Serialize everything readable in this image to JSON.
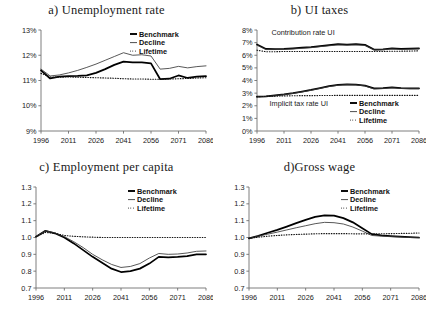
{
  "figure": {
    "panel_count": 4,
    "legend_entries": [
      "Benchmark",
      "Decline",
      "Lifetime"
    ]
  },
  "chart_data": [
    {
      "id": "panel-a",
      "type": "line",
      "title": "a) Unemployment rate",
      "xlabel": "",
      "ylabel": "",
      "grid": false,
      "legend_position": "top-right",
      "x": [
        1996,
        2001,
        2006,
        2011,
        2016,
        2021,
        2026,
        2031,
        2036,
        2041,
        2046,
        2051,
        2056,
        2061,
        2066,
        2071,
        2076,
        2081,
        2086
      ],
      "xlim": [
        1996,
        2086
      ],
      "xticks": [
        1996,
        2011,
        2026,
        2041,
        2056,
        2071,
        2086
      ],
      "xticklabels": [
        "1996",
        "2011",
        "2026",
        "2041",
        "2056",
        "2071",
        "2086"
      ],
      "ylim": [
        9,
        13
      ],
      "yticks": [
        9,
        10,
        11,
        12,
        13
      ],
      "yticklabels": [
        "9%",
        "10%",
        "11%",
        "12%",
        "13%"
      ],
      "series": [
        {
          "name": "Benchmark",
          "style": "thick-solid",
          "values": [
            11.4,
            11.08,
            11.15,
            11.17,
            11.18,
            11.2,
            11.3,
            11.45,
            11.62,
            11.75,
            11.72,
            11.72,
            11.68,
            11.05,
            11.07,
            11.2,
            11.1,
            11.15,
            11.17
          ]
        },
        {
          "name": "Decline",
          "style": "thin-solid",
          "values": [
            11.45,
            11.18,
            11.22,
            11.3,
            11.4,
            11.52,
            11.65,
            11.8,
            11.95,
            12.1,
            12.0,
            12.02,
            11.97,
            11.45,
            11.48,
            11.56,
            11.5,
            11.55,
            11.58
          ]
        },
        {
          "name": "Lifetime",
          "style": "dotted",
          "values": [
            11.28,
            11.14,
            11.13,
            11.14,
            11.13,
            11.12,
            11.11,
            11.1,
            11.09,
            11.07,
            11.06,
            11.06,
            11.05,
            11.05,
            11.06,
            11.07,
            11.08,
            11.1,
            11.11
          ]
        }
      ]
    },
    {
      "id": "panel-b",
      "type": "line",
      "title": "b) UI taxes",
      "xlabel": "",
      "ylabel": "",
      "grid": false,
      "legend_position": "bottom-right",
      "annotations": [
        {
          "text": "Contribution rate UI",
          "x": 2004,
          "y": 7.6
        },
        {
          "text": "Implicit tax rate UI",
          "x": 2003,
          "y": 1.95
        }
      ],
      "x": [
        1996,
        2001,
        2006,
        2011,
        2016,
        2021,
        2026,
        2031,
        2036,
        2041,
        2046,
        2051,
        2056,
        2061,
        2066,
        2071,
        2076,
        2081,
        2086
      ],
      "xlim": [
        1996,
        2086
      ],
      "xticks": [
        1996,
        2011,
        2026,
        2041,
        2056,
        2071,
        2086
      ],
      "xticklabels": [
        "1996",
        "2011",
        "2026",
        "2041",
        "2056",
        "2071",
        "2086"
      ],
      "ylim": [
        0,
        8
      ],
      "yticks": [
        0,
        1,
        2,
        3,
        4,
        5,
        6,
        7,
        8
      ],
      "yticklabels": [
        "0%",
        "1%",
        "2%",
        "3%",
        "4%",
        "5%",
        "6%",
        "7%",
        "8%"
      ],
      "groups": [
        {
          "label": "Contribution rate UI",
          "series": [
            {
              "name": "Benchmark",
              "style": "thick-solid",
              "values": [
                6.85,
                6.5,
                6.48,
                6.5,
                6.55,
                6.6,
                6.65,
                6.72,
                6.8,
                6.88,
                6.85,
                6.88,
                6.82,
                6.45,
                6.47,
                6.55,
                6.5,
                6.52,
                6.55
              ]
            },
            {
              "name": "Decline",
              "style": "thin-solid",
              "values": [
                6.8,
                6.45,
                6.45,
                6.47,
                6.5,
                6.55,
                6.6,
                6.68,
                6.75,
                6.82,
                6.8,
                6.82,
                6.78,
                6.42,
                6.44,
                6.5,
                6.46,
                6.48,
                6.5
              ]
            },
            {
              "name": "Lifetime",
              "style": "dotted",
              "values": [
                6.4,
                6.28,
                6.28,
                6.3,
                6.3,
                6.3,
                6.3,
                6.3,
                6.3,
                6.3,
                6.3,
                6.3,
                6.3,
                6.3,
                6.3,
                6.32,
                6.32,
                6.33,
                6.35
              ]
            }
          ]
        },
        {
          "label": "Implicit tax rate UI",
          "series": [
            {
              "name": "Benchmark",
              "style": "thick-solid",
              "values": [
                2.72,
                2.75,
                2.82,
                2.9,
                3.0,
                3.12,
                3.25,
                3.4,
                3.55,
                3.65,
                3.7,
                3.68,
                3.6,
                3.38,
                3.4,
                3.45,
                3.4,
                3.38,
                3.38
              ]
            },
            {
              "name": "Decline",
              "style": "thin-solid",
              "values": [
                2.7,
                2.73,
                2.8,
                2.88,
                2.98,
                3.1,
                3.22,
                3.38,
                3.52,
                3.62,
                3.67,
                3.65,
                3.57,
                3.33,
                3.36,
                3.42,
                3.37,
                3.35,
                3.35
              ]
            },
            {
              "name": "Lifetime",
              "style": "dotted",
              "values": [
                2.72,
                2.74,
                2.76,
                2.78,
                2.79,
                2.8,
                2.8,
                2.81,
                2.81,
                2.82,
                2.82,
                2.82,
                2.82,
                2.82,
                2.82,
                2.82,
                2.82,
                2.82,
                2.82
              ]
            }
          ]
        }
      ]
    },
    {
      "id": "panel-c",
      "type": "line",
      "title": "c) Employment per capita",
      "xlabel": "",
      "ylabel": "",
      "grid": false,
      "legend_position": "top-right",
      "x": [
        1996,
        2001,
        2006,
        2011,
        2016,
        2021,
        2026,
        2031,
        2036,
        2041,
        2046,
        2051,
        2056,
        2061,
        2066,
        2071,
        2076,
        2081,
        2086
      ],
      "xlim": [
        1996,
        2086
      ],
      "xticks": [
        1996,
        2011,
        2026,
        2041,
        2056,
        2071,
        2086
      ],
      "xticklabels": [
        "1996",
        "2011",
        "2026",
        "2041",
        "2056",
        "2071",
        "2086"
      ],
      "ylim": [
        0.7,
        1.3
      ],
      "yticks": [
        0.7,
        0.8,
        0.9,
        1.0,
        1.1,
        1.2,
        1.3
      ],
      "yticklabels": [
        "0.7",
        "0.8",
        "0.9",
        "1.0",
        "1.1",
        "1.2",
        "1.3"
      ],
      "series": [
        {
          "name": "Benchmark",
          "style": "thick-solid",
          "values": [
            1.005,
            1.04,
            1.025,
            1.0,
            0.965,
            0.925,
            0.885,
            0.85,
            0.815,
            0.795,
            0.8,
            0.815,
            0.845,
            0.885,
            0.882,
            0.885,
            0.89,
            0.9,
            0.9
          ]
        },
        {
          "name": "Decline",
          "style": "thin-solid",
          "values": [
            1.005,
            1.04,
            1.027,
            1.005,
            0.975,
            0.94,
            0.9,
            0.868,
            0.84,
            0.822,
            0.828,
            0.845,
            0.878,
            0.905,
            0.9,
            0.902,
            0.908,
            0.918,
            0.92
          ]
        },
        {
          "name": "Lifetime",
          "style": "dotted",
          "values": [
            1.005,
            1.03,
            1.025,
            1.012,
            1.007,
            1.004,
            1.002,
            1.0,
            1.0,
            1.0,
            1.0,
            1.0,
            1.0,
            1.0,
            1.0,
            1.0,
            1.0,
            1.0,
            1.0
          ]
        }
      ]
    },
    {
      "id": "panel-d",
      "type": "line",
      "title": "d)Gross wage",
      "xlabel": "",
      "ylabel": "",
      "grid": false,
      "legend_position": "top-right",
      "x": [
        1996,
        2001,
        2006,
        2011,
        2016,
        2021,
        2026,
        2031,
        2036,
        2041,
        2046,
        2051,
        2056,
        2061,
        2066,
        2071,
        2076,
        2081,
        2086
      ],
      "xlim": [
        1996,
        2086
      ],
      "xticks": [
        1996,
        2011,
        2026,
        2041,
        2056,
        2071,
        2086
      ],
      "xticklabels": [
        "1996",
        "2011",
        "2026",
        "2041",
        "2056",
        "2071",
        "2086"
      ],
      "ylim": [
        0.7,
        1.3
      ],
      "yticks": [
        0.7,
        0.8,
        0.9,
        1.0,
        1.1,
        1.2,
        1.3
      ],
      "yticklabels": [
        "0.7",
        "0.8",
        "0.9",
        "1.0",
        "1.1",
        "1.2",
        "1.3"
      ],
      "series": [
        {
          "name": "Benchmark",
          "style": "thick-solid",
          "values": [
            0.995,
            1.01,
            1.028,
            1.045,
            1.065,
            1.085,
            1.105,
            1.122,
            1.132,
            1.13,
            1.115,
            1.09,
            1.055,
            1.02,
            1.012,
            1.008,
            1.005,
            1.002,
            1.0
          ]
        },
        {
          "name": "Decline",
          "style": "thin-solid",
          "values": [
            0.995,
            1.008,
            1.02,
            1.032,
            1.045,
            1.058,
            1.07,
            1.082,
            1.09,
            1.088,
            1.08,
            1.062,
            1.038,
            1.012,
            1.008,
            1.005,
            1.003,
            1.0,
            0.998
          ]
        },
        {
          "name": "Lifetime",
          "style": "dotted",
          "values": [
            0.995,
            1.002,
            1.008,
            1.012,
            1.016,
            1.018,
            1.02,
            1.022,
            1.023,
            1.023,
            1.023,
            1.022,
            1.022,
            1.022,
            1.022,
            1.023,
            1.024,
            1.025,
            1.027
          ]
        }
      ]
    }
  ]
}
